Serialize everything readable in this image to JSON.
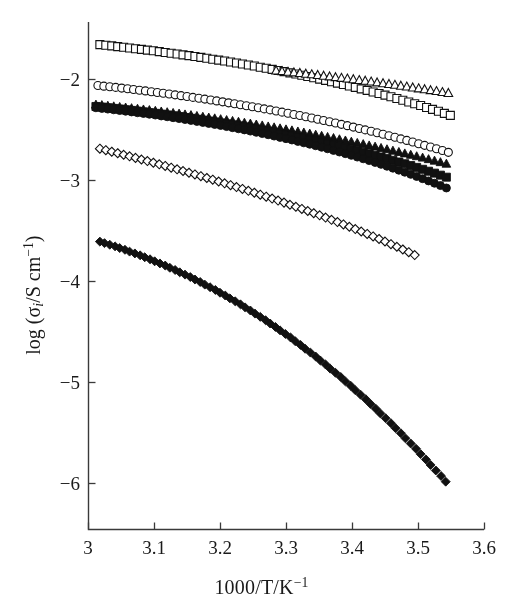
{
  "figure": {
    "title": "",
    "background_color": "#ffffff",
    "axis_color": "#3a3a3a",
    "marker_color": "#111111"
  },
  "axes": {
    "x_title_parts": {
      "main": "1000/T/K",
      "exponent": "−1"
    },
    "y_title_parts": {
      "prefix": "log (σ",
      "subscript": "i",
      "middle": "/S cm",
      "exponent": "−1",
      "suffix": ")"
    },
    "x_tick_labels": [
      "3",
      "3.1",
      "3.2",
      "3.3",
      "3.4",
      "3.5",
      "3.6"
    ],
    "y_tick_labels": [
      "−2",
      "−3",
      "−4",
      "−5",
      "−6"
    ]
  },
  "chart_data": {
    "type": "scatter",
    "title": "",
    "xlabel": "1000/T/K⁻¹",
    "ylabel": "log (σi/S cm⁻¹)",
    "xlim": [
      3.0,
      3.6
    ],
    "ylim": [
      -6.5,
      -1.55
    ],
    "xticks": [
      3.0,
      3.1,
      3.2,
      3.3,
      3.4,
      3.5,
      3.6
    ],
    "yticks": [
      -2,
      -3,
      -4,
      -5,
      -6
    ],
    "grid": false,
    "legend": "none",
    "marker_size": 7,
    "series": [
      {
        "name": "open-squares",
        "marker": "square",
        "fill": "open",
        "color": "#111111",
        "n_points": 60,
        "x": [
          3.018,
          3.027,
          3.036,
          3.045,
          3.054,
          3.063,
          3.072,
          3.081,
          3.09,
          3.099,
          3.108,
          3.117,
          3.126,
          3.135,
          3.144,
          3.153,
          3.162,
          3.171,
          3.18,
          3.189,
          3.198,
          3.207,
          3.216,
          3.225,
          3.234,
          3.243,
          3.252,
          3.261,
          3.27,
          3.279,
          3.288,
          3.297,
          3.306,
          3.315,
          3.324,
          3.333,
          3.342,
          3.351,
          3.36,
          3.369,
          3.378,
          3.387,
          3.396,
          3.405,
          3.414,
          3.423,
          3.432,
          3.441,
          3.45,
          3.459,
          3.468,
          3.477,
          3.486,
          3.495,
          3.504,
          3.513,
          3.522,
          3.531,
          3.54,
          3.549
        ],
        "y": [
          -1.66,
          -1.666,
          -1.672,
          -1.679,
          -1.686,
          -1.693,
          -1.7,
          -1.707,
          -1.714,
          -1.721,
          -1.729,
          -1.737,
          -1.745,
          -1.753,
          -1.761,
          -1.769,
          -1.777,
          -1.786,
          -1.795,
          -1.804,
          -1.813,
          -1.822,
          -1.832,
          -1.842,
          -1.852,
          -1.862,
          -1.872,
          -1.883,
          -1.894,
          -1.905,
          -1.916,
          -1.927,
          -1.939,
          -1.951,
          -1.963,
          -1.975,
          -1.988,
          -2.001,
          -2.014,
          -2.027,
          -2.041,
          -2.055,
          -2.069,
          -2.083,
          -2.098,
          -2.113,
          -2.128,
          -2.144,
          -2.16,
          -2.176,
          -2.193,
          -2.21,
          -2.227,
          -2.245,
          -2.263,
          -2.282,
          -2.301,
          -2.32,
          -2.34,
          -2.36
        ]
      },
      {
        "name": "open-triangles",
        "marker": "triangle",
        "fill": "open",
        "color": "#111111",
        "n_points": 30,
        "x": [
          3.285,
          3.294,
          3.303,
          3.312,
          3.321,
          3.33,
          3.339,
          3.348,
          3.357,
          3.366,
          3.375,
          3.384,
          3.393,
          3.402,
          3.411,
          3.42,
          3.429,
          3.438,
          3.447,
          3.456,
          3.465,
          3.474,
          3.483,
          3.492,
          3.501,
          3.51,
          3.519,
          3.528,
          3.537,
          3.546
        ],
        "y": [
          -1.918,
          -1.924,
          -1.93,
          -1.936,
          -1.942,
          -1.949,
          -1.955,
          -1.962,
          -1.969,
          -1.976,
          -1.983,
          -1.99,
          -1.997,
          -2.004,
          -2.012,
          -2.019,
          -2.027,
          -2.035,
          -2.043,
          -2.051,
          -2.059,
          -2.068,
          -2.076,
          -2.085,
          -2.094,
          -2.103,
          -2.112,
          -2.121,
          -2.131,
          -2.14
        ]
      },
      {
        "name": "open-circles",
        "marker": "circle",
        "fill": "open",
        "color": "#111111",
        "n_points": 60,
        "x": [
          3.015,
          3.024,
          3.033,
          3.042,
          3.051,
          3.06,
          3.069,
          3.078,
          3.087,
          3.096,
          3.105,
          3.114,
          3.123,
          3.132,
          3.141,
          3.15,
          3.159,
          3.168,
          3.177,
          3.186,
          3.195,
          3.204,
          3.213,
          3.222,
          3.231,
          3.24,
          3.249,
          3.258,
          3.267,
          3.276,
          3.285,
          3.294,
          3.303,
          3.312,
          3.321,
          3.33,
          3.339,
          3.348,
          3.357,
          3.366,
          3.375,
          3.384,
          3.393,
          3.402,
          3.411,
          3.42,
          3.429,
          3.438,
          3.447,
          3.456,
          3.465,
          3.474,
          3.483,
          3.492,
          3.501,
          3.51,
          3.519,
          3.528,
          3.537,
          3.546
        ],
        "y": [
          -2.065,
          -2.071,
          -2.077,
          -2.083,
          -2.09,
          -2.097,
          -2.104,
          -2.111,
          -2.118,
          -2.126,
          -2.133,
          -2.141,
          -2.149,
          -2.157,
          -2.165,
          -2.173,
          -2.182,
          -2.19,
          -2.199,
          -2.208,
          -2.217,
          -2.226,
          -2.236,
          -2.245,
          -2.255,
          -2.265,
          -2.275,
          -2.285,
          -2.296,
          -2.306,
          -2.317,
          -2.328,
          -2.339,
          -2.351,
          -2.362,
          -2.374,
          -2.386,
          -2.398,
          -2.411,
          -2.423,
          -2.436,
          -2.449,
          -2.462,
          -2.476,
          -2.49,
          -2.504,
          -2.518,
          -2.532,
          -2.547,
          -2.562,
          -2.577,
          -2.593,
          -2.608,
          -2.624,
          -2.641,
          -2.657,
          -2.674,
          -2.691,
          -2.708,
          -2.726
        ]
      },
      {
        "name": "filled-triangles",
        "marker": "triangle",
        "fill": "filled",
        "color": "#111111",
        "n_points": 60,
        "x": [
          3.012,
          3.021,
          3.03,
          3.039,
          3.048,
          3.057,
          3.066,
          3.075,
          3.084,
          3.093,
          3.102,
          3.111,
          3.12,
          3.129,
          3.138,
          3.147,
          3.156,
          3.165,
          3.174,
          3.183,
          3.192,
          3.201,
          3.21,
          3.219,
          3.228,
          3.237,
          3.246,
          3.255,
          3.264,
          3.273,
          3.282,
          3.291,
          3.3,
          3.309,
          3.318,
          3.327,
          3.336,
          3.345,
          3.354,
          3.363,
          3.372,
          3.381,
          3.39,
          3.399,
          3.408,
          3.417,
          3.426,
          3.435,
          3.444,
          3.453,
          3.462,
          3.471,
          3.48,
          3.489,
          3.498,
          3.507,
          3.516,
          3.525,
          3.534,
          3.543
        ],
        "y": [
          -2.255,
          -2.26,
          -2.266,
          -2.272,
          -2.278,
          -2.284,
          -2.29,
          -2.296,
          -2.303,
          -2.309,
          -2.316,
          -2.323,
          -2.33,
          -2.337,
          -2.344,
          -2.352,
          -2.359,
          -2.367,
          -2.375,
          -2.383,
          -2.391,
          -2.399,
          -2.408,
          -2.416,
          -2.425,
          -2.434,
          -2.443,
          -2.452,
          -2.461,
          -2.471,
          -2.48,
          -2.49,
          -2.5,
          -2.51,
          -2.521,
          -2.531,
          -2.542,
          -2.553,
          -2.564,
          -2.575,
          -2.586,
          -2.598,
          -2.61,
          -2.622,
          -2.634,
          -2.646,
          -2.659,
          -2.671,
          -2.684,
          -2.697,
          -2.711,
          -2.724,
          -2.738,
          -2.752,
          -2.766,
          -2.78,
          -2.795,
          -2.81,
          -2.825,
          -2.84
        ]
      },
      {
        "name": "filled-squares",
        "marker": "square",
        "fill": "filled",
        "color": "#111111",
        "n_points": 60,
        "x": [
          3.012,
          3.021,
          3.03,
          3.039,
          3.048,
          3.057,
          3.066,
          3.075,
          3.084,
          3.093,
          3.102,
          3.111,
          3.12,
          3.129,
          3.138,
          3.147,
          3.156,
          3.165,
          3.174,
          3.183,
          3.192,
          3.201,
          3.21,
          3.219,
          3.228,
          3.237,
          3.246,
          3.255,
          3.264,
          3.273,
          3.282,
          3.291,
          3.3,
          3.309,
          3.318,
          3.327,
          3.336,
          3.345,
          3.354,
          3.363,
          3.372,
          3.381,
          3.39,
          3.399,
          3.408,
          3.417,
          3.426,
          3.435,
          3.444,
          3.453,
          3.462,
          3.471,
          3.48,
          3.489,
          3.498,
          3.507,
          3.516,
          3.525,
          3.534,
          3.543
        ],
        "y": [
          -2.272,
          -2.278,
          -2.284,
          -2.291,
          -2.297,
          -2.304,
          -2.311,
          -2.318,
          -2.325,
          -2.333,
          -2.34,
          -2.348,
          -2.356,
          -2.364,
          -2.372,
          -2.381,
          -2.389,
          -2.398,
          -2.407,
          -2.416,
          -2.425,
          -2.435,
          -2.444,
          -2.454,
          -2.464,
          -2.474,
          -2.485,
          -2.495,
          -2.506,
          -2.517,
          -2.528,
          -2.54,
          -2.551,
          -2.563,
          -2.575,
          -2.588,
          -2.6,
          -2.613,
          -2.626,
          -2.639,
          -2.653,
          -2.667,
          -2.681,
          -2.695,
          -2.71,
          -2.725,
          -2.74,
          -2.756,
          -2.772,
          -2.788,
          -2.805,
          -2.822,
          -2.839,
          -2.857,
          -2.875,
          -2.894,
          -2.913,
          -2.932,
          -2.952,
          -2.972
        ]
      },
      {
        "name": "filled-circles",
        "marker": "circle",
        "fill": "filled",
        "color": "#111111",
        "n_points": 60,
        "x": [
          3.012,
          3.021,
          3.03,
          3.039,
          3.048,
          3.057,
          3.066,
          3.075,
          3.084,
          3.093,
          3.102,
          3.111,
          3.12,
          3.129,
          3.138,
          3.147,
          3.156,
          3.165,
          3.174,
          3.183,
          3.192,
          3.201,
          3.21,
          3.219,
          3.228,
          3.237,
          3.246,
          3.255,
          3.264,
          3.273,
          3.282,
          3.291,
          3.3,
          3.309,
          3.318,
          3.327,
          3.336,
          3.345,
          3.354,
          3.363,
          3.372,
          3.381,
          3.39,
          3.399,
          3.408,
          3.417,
          3.426,
          3.435,
          3.444,
          3.453,
          3.462,
          3.471,
          3.48,
          3.489,
          3.498,
          3.507,
          3.516,
          3.525,
          3.534,
          3.543
        ],
        "y": [
          -2.285,
          -2.291,
          -2.298,
          -2.305,
          -2.312,
          -2.319,
          -2.326,
          -2.334,
          -2.341,
          -2.349,
          -2.357,
          -2.366,
          -2.374,
          -2.383,
          -2.392,
          -2.401,
          -2.41,
          -2.42,
          -2.43,
          -2.44,
          -2.45,
          -2.46,
          -2.471,
          -2.482,
          -2.493,
          -2.504,
          -2.516,
          -2.528,
          -2.54,
          -2.552,
          -2.565,
          -2.578,
          -2.591,
          -2.604,
          -2.618,
          -2.632,
          -2.646,
          -2.661,
          -2.676,
          -2.691,
          -2.707,
          -2.723,
          -2.739,
          -2.756,
          -2.773,
          -2.79,
          -2.808,
          -2.826,
          -2.845,
          -2.864,
          -2.883,
          -2.903,
          -2.923,
          -2.944,
          -2.965,
          -2.987,
          -3.009,
          -3.032,
          -3.055,
          -3.079
        ]
      },
      {
        "name": "open-diamonds",
        "marker": "diamond",
        "fill": "open",
        "color": "#111111",
        "n_points": 54,
        "x": [
          3.018,
          3.027,
          3.036,
          3.045,
          3.054,
          3.063,
          3.072,
          3.081,
          3.09,
          3.099,
          3.108,
          3.117,
          3.126,
          3.135,
          3.144,
          3.153,
          3.162,
          3.171,
          3.18,
          3.189,
          3.198,
          3.207,
          3.216,
          3.225,
          3.234,
          3.243,
          3.252,
          3.261,
          3.27,
          3.279,
          3.288,
          3.297,
          3.306,
          3.315,
          3.324,
          3.333,
          3.342,
          3.351,
          3.36,
          3.369,
          3.378,
          3.387,
          3.396,
          3.405,
          3.414,
          3.423,
          3.432,
          3.441,
          3.45,
          3.459,
          3.468,
          3.477,
          3.486,
          3.495
        ],
        "y": [
          -2.69,
          -2.705,
          -2.72,
          -2.735,
          -2.75,
          -2.766,
          -2.781,
          -2.797,
          -2.813,
          -2.829,
          -2.845,
          -2.861,
          -2.878,
          -2.894,
          -2.911,
          -2.928,
          -2.945,
          -2.962,
          -2.98,
          -2.997,
          -3.015,
          -3.033,
          -3.051,
          -3.07,
          -3.088,
          -3.107,
          -3.126,
          -3.145,
          -3.165,
          -3.184,
          -3.204,
          -3.224,
          -3.245,
          -3.265,
          -3.286,
          -3.307,
          -3.329,
          -3.35,
          -3.372,
          -3.394,
          -3.417,
          -3.44,
          -3.463,
          -3.486,
          -3.51,
          -3.534,
          -3.559,
          -3.584,
          -3.609,
          -3.635,
          -3.661,
          -3.688,
          -3.715,
          -3.743
        ]
      },
      {
        "name": "filled-diamonds-vtf",
        "marker": "diamond",
        "fill": "filled",
        "color": "#111111",
        "n_points": 70,
        "x": [
          3.018,
          3.025,
          3.033,
          3.041,
          3.048,
          3.056,
          3.063,
          3.071,
          3.079,
          3.086,
          3.094,
          3.101,
          3.109,
          3.117,
          3.124,
          3.132,
          3.139,
          3.147,
          3.155,
          3.162,
          3.17,
          3.177,
          3.185,
          3.193,
          3.2,
          3.208,
          3.215,
          3.223,
          3.231,
          3.238,
          3.246,
          3.253,
          3.261,
          3.269,
          3.276,
          3.284,
          3.291,
          3.299,
          3.307,
          3.314,
          3.322,
          3.329,
          3.337,
          3.345,
          3.352,
          3.36,
          3.367,
          3.375,
          3.383,
          3.39,
          3.398,
          3.405,
          3.413,
          3.421,
          3.428,
          3.436,
          3.443,
          3.451,
          3.459,
          3.466,
          3.474,
          3.481,
          3.489,
          3.497,
          3.504,
          3.512,
          3.519,
          3.527,
          3.535,
          3.542
        ],
        "y": [
          -3.61,
          -3.625,
          -3.641,
          -3.657,
          -3.674,
          -3.691,
          -3.709,
          -3.727,
          -3.746,
          -3.765,
          -3.785,
          -3.805,
          -3.826,
          -3.847,
          -3.869,
          -3.891,
          -3.914,
          -3.937,
          -3.961,
          -3.985,
          -4.01,
          -4.036,
          -4.062,
          -4.089,
          -4.116,
          -4.144,
          -4.172,
          -4.201,
          -4.231,
          -4.261,
          -4.292,
          -4.323,
          -4.355,
          -4.388,
          -4.421,
          -4.455,
          -4.489,
          -4.524,
          -4.56,
          -4.596,
          -4.633,
          -4.671,
          -4.709,
          -4.748,
          -4.787,
          -4.827,
          -4.868,
          -4.909,
          -4.951,
          -4.994,
          -5.037,
          -5.081,
          -5.126,
          -5.171,
          -5.217,
          -5.264,
          -5.311,
          -5.359,
          -5.408,
          -5.457,
          -5.507,
          -5.558,
          -5.609,
          -5.661,
          -5.714,
          -5.767,
          -5.821,
          -5.876,
          -5.931,
          -5.987
        ]
      }
    ]
  }
}
